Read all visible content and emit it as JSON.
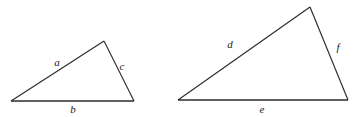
{
  "figure": {
    "background_color": "#ffffff",
    "stroke_color": "#2b2b2b",
    "label_color": "#1a1a1a",
    "width": 362,
    "height": 117
  },
  "triangles": [
    {
      "id": "left-triangle",
      "name": "small-triangle",
      "vertices": {
        "left": {
          "x": 11,
          "y": 101
        },
        "apex": {
          "x": 104,
          "y": 41
        },
        "right": {
          "x": 134,
          "y": 101
        }
      },
      "labels": {
        "hypotenuse": {
          "text": "a",
          "x": 57,
          "y": 63
        },
        "base": {
          "text": "b",
          "x": 73,
          "y": 110
        },
        "right_side": {
          "text": "c",
          "x": 122,
          "y": 67
        }
      }
    },
    {
      "id": "right-triangle",
      "name": "large-triangle",
      "vertices": {
        "left": {
          "x": 178,
          "y": 100
        },
        "apex": {
          "x": 310,
          "y": 7
        },
        "right": {
          "x": 348,
          "y": 100
        }
      },
      "labels": {
        "hypotenuse": {
          "text": "d",
          "x": 230,
          "y": 45
        },
        "base": {
          "text": "e",
          "x": 262,
          "y": 110
        },
        "right_side": {
          "text": "f",
          "x": 338,
          "y": 48
        }
      }
    }
  ]
}
